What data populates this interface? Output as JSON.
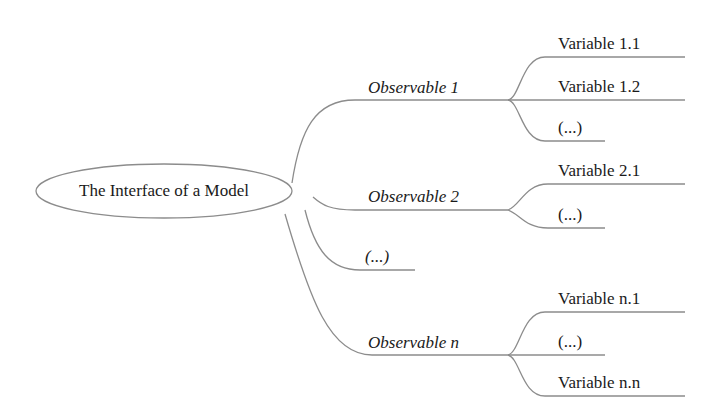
{
  "root": {
    "label": "The Interface of a Model"
  },
  "observables": [
    {
      "label": "Observable 1",
      "variables": [
        "Variable 1.1",
        "Variable 1.2",
        "(...)"
      ]
    },
    {
      "label": "Observable 2",
      "variables": [
        "Variable 2.1",
        "(...)"
      ]
    },
    {
      "label": "(...)",
      "variables": []
    },
    {
      "label": "Observable n",
      "variables": [
        "Variable n.1",
        "(...)",
        "Variable n.n"
      ]
    }
  ],
  "colors": {
    "line": "#8c8c8c",
    "text": "#1a1a1a"
  }
}
